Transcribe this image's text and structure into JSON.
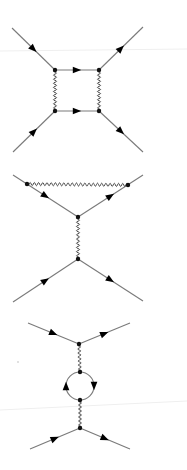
{
  "colors": {
    "fermion": "#7a7a7a",
    "photon": "#3a3a3a",
    "vertex": "#111111",
    "arrow": "#000000",
    "artifact": "#ececec",
    "background": "#ffffff"
  },
  "diagrams": [
    {
      "name": "box-diagram",
      "fermions": [
        {
          "from": [
            12,
            28
          ],
          "to": [
            55,
            70
          ]
        },
        {
          "from": [
            13,
            152
          ],
          "to": [
            55,
            111
          ]
        },
        {
          "from": [
            99,
            70
          ],
          "to": [
            143,
            27
          ]
        },
        {
          "from": [
            99,
            111
          ],
          "to": [
            143,
            152
          ]
        },
        {
          "from": [
            55,
            70
          ],
          "to": [
            99,
            70
          ]
        },
        {
          "from": [
            55,
            111
          ],
          "to": [
            99,
            111
          ]
        }
      ],
      "photons": [
        {
          "from": [
            55,
            70
          ],
          "to": [
            55,
            111
          ]
        },
        {
          "from": [
            99,
            70
          ],
          "to": [
            99,
            111
          ]
        }
      ],
      "vertices": [
        [
          55,
          70
        ],
        [
          99,
          70
        ],
        [
          55,
          111
        ],
        [
          99,
          111
        ]
      ],
      "loops": []
    },
    {
      "name": "vertex-correction-diagram",
      "fermions": [
        {
          "from": [
            13,
            175
          ],
          "to": [
            78,
            217
          ]
        },
        {
          "from": [
            78,
            217
          ],
          "to": [
            143,
            175
          ]
        },
        {
          "from": [
            13,
            302
          ],
          "to": [
            78,
            259
          ]
        },
        {
          "from": [
            78,
            259
          ],
          "to": [
            143,
            301
          ]
        }
      ],
      "photons": [
        {
          "from": [
            27,
            184
          ],
          "to": [
            128,
            185
          ]
        },
        {
          "from": [
            78,
            217
          ],
          "to": [
            78,
            259
          ]
        }
      ],
      "vertices": [
        [
          27,
          184
        ],
        [
          128,
          185
        ],
        [
          78,
          217
        ],
        [
          78,
          259
        ]
      ],
      "loops": []
    },
    {
      "name": "vacuum-polarization-diagram",
      "fermions": [
        {
          "from": [
            28,
            323
          ],
          "to": [
            79,
            344
          ]
        },
        {
          "from": [
            79,
            344
          ],
          "to": [
            130,
            323
          ]
        },
        {
          "from": [
            30,
            449
          ],
          "to": [
            80,
            428
          ]
        },
        {
          "from": [
            80,
            428
          ],
          "to": [
            130,
            449
          ]
        }
      ],
      "photons": [
        {
          "from": [
            79,
            344
          ],
          "to": [
            80,
            372
          ]
        },
        {
          "from": [
            80,
            400
          ],
          "to": [
            80,
            428
          ]
        }
      ],
      "vertices": [
        [
          79,
          344
        ],
        [
          80,
          372
        ],
        [
          80,
          400
        ],
        [
          80,
          428
        ]
      ],
      "loops": [
        {
          "center": [
            80,
            386
          ],
          "radius": 14
        }
      ]
    }
  ]
}
